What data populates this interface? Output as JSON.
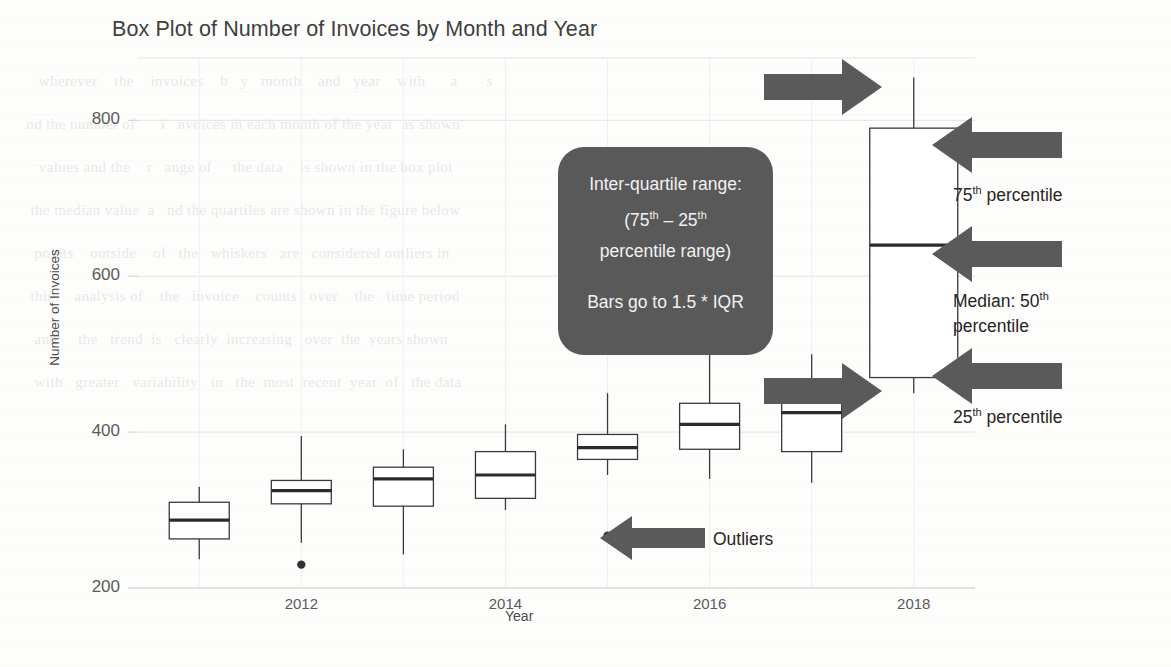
{
  "chart_data": {
    "type": "box",
    "title": "Box Plot of Number of Invoices by Month and Year",
    "xlabel": "Year",
    "ylabel": "Number of Invoices",
    "xlim": [
      2010.4,
      2018.6
    ],
    "ylim": [
      200,
      880
    ],
    "ytick_labels": [
      "800",
      "600",
      "400",
      "200"
    ],
    "ytick_values": [
      800,
      600,
      400,
      200
    ],
    "xtick_labels": [
      "2012",
      "2014",
      "2016",
      "2018"
    ],
    "xtick_values": [
      2012,
      2014,
      2016,
      2018
    ],
    "grid": true,
    "legend": "none",
    "boxes": [
      {
        "x": 2011,
        "whisker_low": 237,
        "q1": 263,
        "median": 287,
        "q3": 310,
        "whisker_high": 330,
        "outliers": []
      },
      {
        "x": 2012,
        "whisker_low": 258,
        "q1": 308,
        "median": 325,
        "q3": 338,
        "whisker_high": 395,
        "outliers": [
          230
        ]
      },
      {
        "x": 2013,
        "whisker_low": 243,
        "q1": 305,
        "median": 340,
        "q3": 355,
        "whisker_high": 378,
        "outliers": []
      },
      {
        "x": 2014,
        "whisker_low": 300,
        "q1": 315,
        "median": 345,
        "q3": 375,
        "whisker_high": 410,
        "outliers": []
      },
      {
        "x": 2015,
        "whisker_low": 345,
        "q1": 365,
        "median": 380,
        "q3": 397,
        "whisker_high": 450,
        "outliers": [
          267
        ]
      },
      {
        "x": 2016,
        "whisker_low": 340,
        "q1": 378,
        "median": 410,
        "q3": 437,
        "whisker_high": 505,
        "outliers": []
      },
      {
        "x": 2017,
        "whisker_low": 335,
        "q1": 375,
        "median": 425,
        "q3": 448,
        "whisker_high": 500,
        "outliers": []
      },
      {
        "x": 2018,
        "whisker_low": 450,
        "q1": 470,
        "median": 640,
        "q3": 790,
        "whisker_high": 855,
        "outliers": []
      }
    ]
  },
  "callout": {
    "line1": "Inter-quartile range:",
    "line2_pre": "(75",
    "line2_sup1": "th",
    "line2_mid": " – 25",
    "line2_sup2": "th",
    "line3": "percentile range)",
    "line4": "Bars go to 1.5 * IQR"
  },
  "annotations": {
    "p75": {
      "text_pre": "75",
      "sup": "th",
      "text_post": " percentile"
    },
    "median": {
      "text_pre": "Median:  50",
      "sup": "th",
      "text_post": "",
      "line2": "percentile"
    },
    "p25": {
      "text_pre": "25",
      "sup": "th",
      "text_post": " percentile"
    },
    "outliers": {
      "label": "Outliers"
    }
  },
  "colors": {
    "arrow": "#5a5a5a",
    "callout_bg": "#595959",
    "callout_text": "#f2f2f2",
    "box_stroke": "#3a3a3a",
    "median_stroke": "#2b2b2b",
    "grid": "#e3e3e3",
    "axis": "#d6d6d6",
    "text": "#4a4a4a",
    "title": "#3f3f3f",
    "background": "#fdfdfc"
  },
  "ghost_text": "     wherever    the    invoices    b   y   month    and   year    with      a       s\n  nd the number of      i   nvoices in each month of the year  as shown\n     values and the    r   ange of     the data    is shown in the box plot\n   the median value  a   nd the quartiles are shown in the figure below\n    points    outside    of   the   whiskers   are   considered outliers in\n   this     analysis of    the   invoice    counts   over    the   time period\n    and     the   trend  is   clearly  increasing   over  the  years shown\n    with   greater   variability   in   the  most  recent  year  of   the data"
}
